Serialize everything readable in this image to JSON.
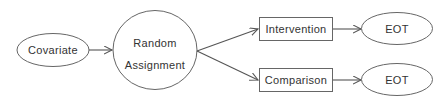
{
  "diagram": {
    "type": "flowchart",
    "colors": {
      "stroke": "#555555",
      "text": "#333333",
      "background": "#ffffff"
    },
    "nodes": {
      "covariate": {
        "label": "Covariate",
        "shape": "ellipse"
      },
      "random_assignment": {
        "label_line1": "Random",
        "label_line2": "Assignment",
        "shape": "circle"
      },
      "intervention": {
        "label": "Intervention",
        "shape": "rectangle"
      },
      "comparison": {
        "label": "Comparison",
        "shape": "rectangle"
      },
      "eot_top": {
        "label": "EOT",
        "shape": "ellipse"
      },
      "eot_bottom": {
        "label": "EOT",
        "shape": "ellipse"
      }
    },
    "edges": [
      {
        "from": "Covariate",
        "to": "Random Assignment"
      },
      {
        "from": "Random Assignment",
        "to": "Intervention"
      },
      {
        "from": "Random Assignment",
        "to": "Comparison"
      },
      {
        "from": "Intervention",
        "to": "EOT"
      },
      {
        "from": "Comparison",
        "to": "EOT"
      }
    ]
  }
}
